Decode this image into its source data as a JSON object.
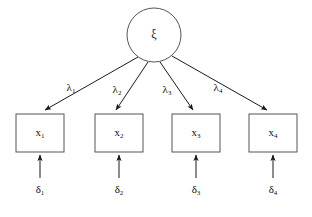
{
  "diagram": {
    "type": "sem-path-diagram",
    "title": "",
    "background_color": "#ffffff",
    "line_color": "#1a1a1a",
    "shape_stroke_color": "#555555",
    "text_color": "#111111"
  },
  "latent_factor": {
    "id": "xi",
    "symbol": "ξ",
    "subscript": "",
    "shape": "ellipse",
    "cx": 154,
    "cy": 35,
    "rx": 27,
    "ry": 27
  },
  "loadings": [
    {
      "id": "lambda-1",
      "symbol": "λ",
      "subscript": "1",
      "x": 71,
      "y": 88
    },
    {
      "id": "lambda-2",
      "symbol": "λ",
      "subscript": "2",
      "x": 117,
      "y": 90
    },
    {
      "id": "lambda-3",
      "symbol": "λ",
      "subscript": "3",
      "x": 167,
      "y": 90
    },
    {
      "id": "lambda-4",
      "symbol": "λ",
      "subscript": "4",
      "x": 218,
      "y": 88
    }
  ],
  "indicators": [
    {
      "id": "x-1",
      "symbol": "x",
      "subscript": "1",
      "box_x": 16,
      "box_y": 114,
      "box_w": 48,
      "box_h": 38
    },
    {
      "id": "x-2",
      "symbol": "x",
      "subscript": "2",
      "box_x": 95,
      "box_y": 114,
      "box_w": 48,
      "box_h": 38
    },
    {
      "id": "x-3",
      "symbol": "x",
      "subscript": "3",
      "box_x": 172,
      "box_y": 114,
      "box_w": 48,
      "box_h": 38
    },
    {
      "id": "x-4",
      "symbol": "x",
      "subscript": "4",
      "box_x": 249,
      "box_y": 114,
      "box_w": 48,
      "box_h": 38
    }
  ],
  "errors": [
    {
      "id": "delta-1",
      "symbol": "δ",
      "subscript": "1",
      "x": 40,
      "y": 190
    },
    {
      "id": "delta-2",
      "symbol": "δ",
      "subscript": "2",
      "x": 119,
      "y": 190
    },
    {
      "id": "delta-3",
      "symbol": "δ",
      "subscript": "3",
      "x": 196,
      "y": 190
    },
    {
      "id": "delta-4",
      "symbol": "δ",
      "subscript": "4",
      "x": 273,
      "y": 190
    }
  ],
  "loading_paths": [
    {
      "id": "path-xi-x1",
      "x1": 138,
      "y1": 57,
      "x2": 45,
      "y2": 110
    },
    {
      "id": "path-xi-x2",
      "x1": 148,
      "y1": 62,
      "x2": 116,
      "y2": 110
    },
    {
      "id": "path-xi-x3",
      "x1": 160,
      "y1": 62,
      "x2": 193,
      "y2": 110
    },
    {
      "id": "path-xi-x4",
      "x1": 172,
      "y1": 56,
      "x2": 267,
      "y2": 110
    }
  ],
  "error_paths": [
    {
      "id": "path-d1-x1",
      "x1": 40,
      "y1": 178,
      "x2": 40,
      "y2": 155
    },
    {
      "id": "path-d2-x2",
      "x1": 119,
      "y1": 178,
      "x2": 119,
      "y2": 155
    },
    {
      "id": "path-d3-x3",
      "x1": 196,
      "y1": 178,
      "x2": 196,
      "y2": 155
    },
    {
      "id": "path-d4-x4",
      "x1": 273,
      "y1": 178,
      "x2": 273,
      "y2": 155
    }
  ]
}
